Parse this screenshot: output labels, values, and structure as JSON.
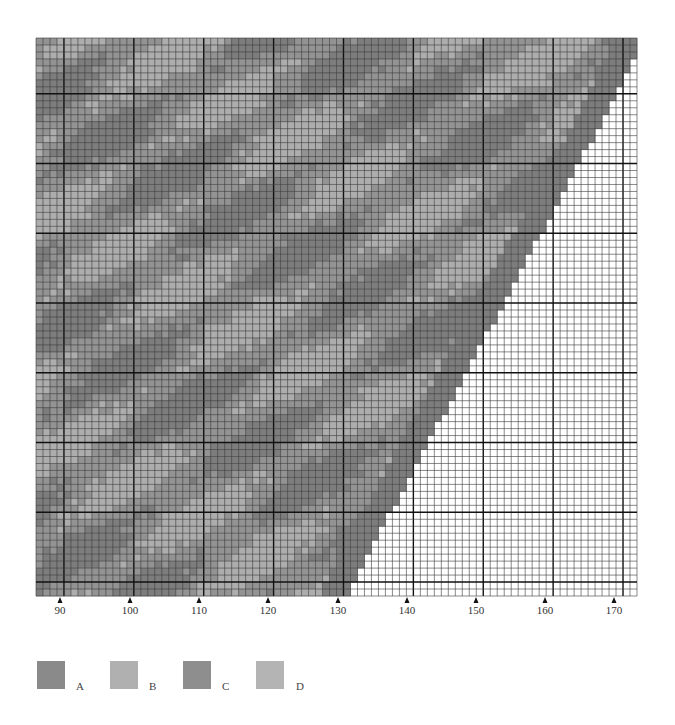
{
  "chart_data": {
    "type": "heatmap",
    "title": "",
    "grid": {
      "columns": 86,
      "rows": 80,
      "major_every": 10,
      "first_major_col": 4,
      "first_major_row": 8
    },
    "xaxis": {
      "tick_labels": [
        "90",
        "100",
        "110",
        "120",
        "130",
        "140",
        "150",
        "160",
        "170"
      ],
      "tick_values": [
        90,
        100,
        110,
        120,
        130,
        140,
        150,
        160,
        170
      ],
      "xlabel": ""
    },
    "yaxis": {
      "ylabel": ""
    },
    "shaded_region": {
      "full_width_rows": 3,
      "boundary": "diagonal staircase from top-right (col 86, row 3) to bottom (col ~44, row 80)"
    },
    "legend": [
      {
        "key": "A",
        "color": "#8a8a8a"
      },
      {
        "key": "B",
        "color": "#b0b0b0"
      },
      {
        "key": "C",
        "color": "#8e8e8e"
      },
      {
        "key": "D",
        "color": "#b4b4b4"
      }
    ],
    "grid_on": true,
    "legend_position": "bottom-left"
  },
  "colors": {
    "minor_line": "#3a3a3a",
    "major_line": "#111111",
    "empty_cell": "#ffffff",
    "shade_dark": "#7d7d7d",
    "shade_mid": "#939393",
    "shade_light": "#adadad"
  }
}
